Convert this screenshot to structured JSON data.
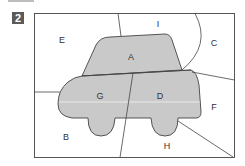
{
  "badge": {
    "number": "2",
    "color": "#5a5a5a"
  },
  "diagram": {
    "car_fill_color": "#c9c9c9",
    "line_color": "#444444",
    "regions": [
      {
        "id": "A",
        "label": "A",
        "x": 131,
        "y": 60,
        "in_car": true
      },
      {
        "id": "B",
        "label": "B",
        "x": 66,
        "y": 140,
        "in_car": false
      },
      {
        "id": "C",
        "label": "C",
        "x": 214,
        "y": 46,
        "in_car": false
      },
      {
        "id": "D",
        "label": "D",
        "x": 160,
        "y": 99,
        "in_car": true
      },
      {
        "id": "E",
        "label": "E",
        "x": 62,
        "y": 43,
        "in_car": false
      },
      {
        "id": "F",
        "label": "F",
        "x": 214,
        "y": 110,
        "in_car": false
      },
      {
        "id": "G",
        "label": "G",
        "x": 100,
        "y": 99,
        "in_car": true
      },
      {
        "id": "H",
        "label": "H",
        "x": 167,
        "y": 149,
        "in_car": false
      },
      {
        "id": "I",
        "label": "I",
        "x": 158,
        "y": 27,
        "in_car": false
      }
    ]
  }
}
